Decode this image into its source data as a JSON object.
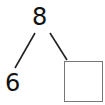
{
  "number_bond": {
    "whole": "8",
    "parts": [
      {
        "value": "6",
        "type": "number"
      },
      {
        "value": "",
        "type": "empty-box"
      }
    ]
  },
  "colors": {
    "text": "#111111",
    "lines": "#222222",
    "box_border": "#777777"
  }
}
